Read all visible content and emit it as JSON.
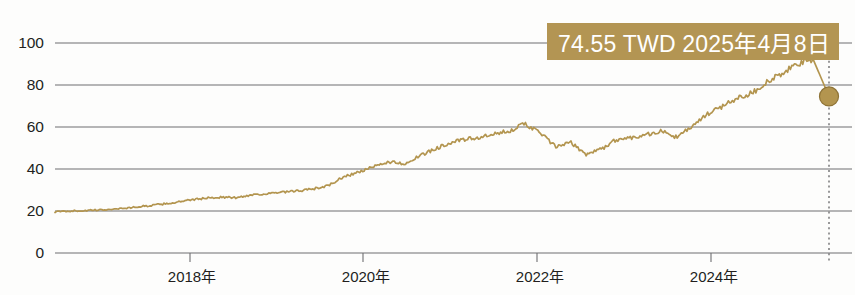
{
  "chart_data": {
    "type": "line",
    "title": "",
    "xlabel": "",
    "ylabel": "",
    "ylim": [
      0,
      100
    ],
    "yticks": [
      0,
      20,
      40,
      60,
      80,
      100
    ],
    "ytick_labels": [
      "0",
      "20",
      "40",
      "60",
      "80",
      "100"
    ],
    "xtick_labels": [
      "2018年",
      "2020年",
      "2022年",
      "2024年"
    ],
    "xlim": [
      "2017-01",
      "2025-04-08"
    ],
    "grid": true,
    "legend": false,
    "series": [
      {
        "name": "TWD price",
        "color": "#b3954f",
        "units": "TWD",
        "x": [
          "2017-01",
          "2017-03",
          "2017-05",
          "2017-07",
          "2017-09",
          "2017-11",
          "2018-01",
          "2018-03",
          "2018-05",
          "2018-07",
          "2018-09",
          "2018-11",
          "2019-01",
          "2019-03",
          "2019-05",
          "2019-07",
          "2019-09",
          "2019-11",
          "2020-01",
          "2020-03",
          "2020-04",
          "2020-06",
          "2020-08",
          "2020-10",
          "2020-12",
          "2021-02",
          "2021-04",
          "2021-06",
          "2021-08",
          "2021-10",
          "2021-12",
          "2022-02",
          "2022-04",
          "2022-06",
          "2022-08",
          "2022-10",
          "2022-12",
          "2023-02",
          "2023-04",
          "2023-06",
          "2023-08",
          "2023-10",
          "2023-12",
          "2024-02",
          "2024-04",
          "2024-06",
          "2024-08",
          "2024-10",
          "2024-12",
          "2025-02",
          "2025-03",
          "2025-04-08"
        ],
        "values": [
          19.6,
          20.0,
          20.2,
          20.5,
          21.0,
          21.6,
          22.4,
          23.2,
          24.1,
          25.3,
          26.2,
          26.6,
          26.3,
          27.8,
          28.2,
          28.9,
          29.5,
          30.5,
          32.0,
          36.2,
          38.5,
          41.0,
          43.5,
          42.5,
          46.0,
          49.5,
          52.5,
          54.0,
          55.0,
          56.5,
          58.5,
          61.5,
          57.0,
          50.5,
          52.5,
          47.0,
          49.5,
          54.0,
          55.0,
          56.5,
          58.0,
          55.0,
          60.5,
          66.0,
          70.0,
          74.0,
          76.5,
          82.0,
          85.5,
          90.5,
          91.5,
          74.55
        ]
      }
    ],
    "annotation": {
      "label": "74.55 TWD 2025年4月8日",
      "value": 74.55,
      "currency": "TWD",
      "date": "2025年4月8日",
      "box_color": "#b39553",
      "text_color": "#ffffff",
      "marker_color": "#b3954f",
      "marker_border": "#8e7336"
    }
  },
  "axis": {
    "y_labels": [
      "100",
      "80",
      "60",
      "40",
      "20",
      "0"
    ],
    "x_labels": [
      "2018年",
      "2020年",
      "2022年",
      "2024年"
    ]
  },
  "colors": {
    "line": "#b3954f",
    "grid": "#6e6e70",
    "text": "#221f1d",
    "accent": "#b39553",
    "background": "#fdfdfc"
  }
}
